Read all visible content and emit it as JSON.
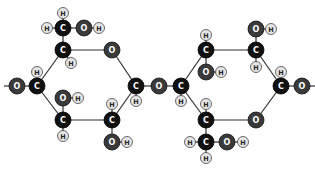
{
  "diagram": {
    "type": "molecular-structure",
    "colors": {
      "carbon": "#111111",
      "oxygen": "#3a3a3a",
      "hydrogen": "#e6e6e6",
      "carbon_label": "#ffffff",
      "oxygen_label": "#ffffff",
      "hydrogen_label": "#222222",
      "bond": "#333333"
    },
    "atoms": [
      {
        "id": "o1",
        "el": "O",
        "x": 17,
        "y": 86
      },
      {
        "id": "c1",
        "el": "C",
        "x": 37,
        "y": 86
      },
      {
        "id": "h1",
        "el": "H",
        "x": 37,
        "y": 72
      },
      {
        "id": "c5",
        "el": "C",
        "x": 63,
        "y": 50
      },
      {
        "id": "h5",
        "el": "H",
        "x": 71,
        "y": 63
      },
      {
        "id": "c6",
        "el": "C",
        "x": 63,
        "y": 28
      },
      {
        "id": "h6a",
        "el": "H",
        "x": 47,
        "y": 28
      },
      {
        "id": "h6b",
        "el": "H",
        "x": 63,
        "y": 13
      },
      {
        "id": "o6",
        "el": "O",
        "x": 84,
        "y": 28
      },
      {
        "id": "ho6",
        "el": "H",
        "x": 99,
        "y": 28
      },
      {
        "id": "or1",
        "el": "O",
        "x": 112,
        "y": 50
      },
      {
        "id": "c4",
        "el": "C",
        "x": 136,
        "y": 86
      },
      {
        "id": "h4",
        "el": "H",
        "x": 136,
        "y": 101
      },
      {
        "id": "olink",
        "el": "O",
        "x": 159,
        "y": 86
      },
      {
        "id": "c2",
        "el": "C",
        "x": 63,
        "y": 120
      },
      {
        "id": "o2",
        "el": "O",
        "x": 63,
        "y": 98
      },
      {
        "id": "ho2",
        "el": "H",
        "x": 78,
        "y": 98
      },
      {
        "id": "h2",
        "el": "H",
        "x": 63,
        "y": 136
      },
      {
        "id": "c3",
        "el": "C",
        "x": 112,
        "y": 120
      },
      {
        "id": "h3",
        "el": "H",
        "x": 112,
        "y": 104
      },
      {
        "id": "o3",
        "el": "O",
        "x": 112,
        "y": 142
      },
      {
        "id": "ho3",
        "el": "H",
        "x": 127,
        "y": 142
      },
      {
        "id": "rc1",
        "el": "C",
        "x": 181,
        "y": 86
      },
      {
        "id": "rh1",
        "el": "H",
        "x": 181,
        "y": 101
      },
      {
        "id": "rc2",
        "el": "C",
        "x": 206,
        "y": 50
      },
      {
        "id": "rh2",
        "el": "H",
        "x": 206,
        "y": 35
      },
      {
        "id": "ro2",
        "el": "O",
        "x": 206,
        "y": 72
      },
      {
        "id": "rho2",
        "el": "H",
        "x": 221,
        "y": 72
      },
      {
        "id": "rc3",
        "el": "C",
        "x": 256,
        "y": 50
      },
      {
        "id": "ro3",
        "el": "O",
        "x": 256,
        "y": 29
      },
      {
        "id": "rho3",
        "el": "H",
        "x": 271,
        "y": 29
      },
      {
        "id": "rh3",
        "el": "H",
        "x": 256,
        "y": 67
      },
      {
        "id": "rc4",
        "el": "C",
        "x": 281,
        "y": 86
      },
      {
        "id": "rh4",
        "el": "H",
        "x": 281,
        "y": 72
      },
      {
        "id": "ro4",
        "el": "O",
        "x": 302,
        "y": 86
      },
      {
        "id": "ror",
        "el": "O",
        "x": 256,
        "y": 120
      },
      {
        "id": "rc5",
        "el": "C",
        "x": 206,
        "y": 120
      },
      {
        "id": "rh5",
        "el": "H",
        "x": 206,
        "y": 104
      },
      {
        "id": "rc6",
        "el": "C",
        "x": 206,
        "y": 142
      },
      {
        "id": "rh6a",
        "el": "H",
        "x": 190,
        "y": 142
      },
      {
        "id": "rh6b",
        "el": "H",
        "x": 206,
        "y": 158
      },
      {
        "id": "ro6",
        "el": "O",
        "x": 227,
        "y": 142
      },
      {
        "id": "rho6",
        "el": "H",
        "x": 243,
        "y": 142
      }
    ],
    "bonds": [
      [
        "o1",
        "c1"
      ],
      [
        "c1",
        "h1"
      ],
      [
        "c1",
        "c5"
      ],
      [
        "c5",
        "h5"
      ],
      [
        "c5",
        "c6"
      ],
      [
        "c6",
        "h6a"
      ],
      [
        "c6",
        "h6b"
      ],
      [
        "c6",
        "o6"
      ],
      [
        "o6",
        "ho6"
      ],
      [
        "c5",
        "or1"
      ],
      [
        "or1",
        "c4"
      ],
      [
        "c4",
        "h4"
      ],
      [
        "c4",
        "olink"
      ],
      [
        "c1",
        "c2"
      ],
      [
        "c2",
        "o2"
      ],
      [
        "o2",
        "ho2"
      ],
      [
        "c2",
        "h2"
      ],
      [
        "c2",
        "c3"
      ],
      [
        "c3",
        "h3"
      ],
      [
        "c3",
        "o3"
      ],
      [
        "o3",
        "ho3"
      ],
      [
        "c3",
        "c4"
      ],
      [
        "olink",
        "rc1"
      ],
      [
        "rc1",
        "rh1"
      ],
      [
        "rc1",
        "rc2"
      ],
      [
        "rc2",
        "rh2"
      ],
      [
        "rc2",
        "ro2"
      ],
      [
        "ro2",
        "rho2"
      ],
      [
        "rc2",
        "rc3"
      ],
      [
        "rc3",
        "ro3"
      ],
      [
        "ro3",
        "rho3"
      ],
      [
        "rc3",
        "rh3"
      ],
      [
        "rc3",
        "rc4"
      ],
      [
        "rc4",
        "rh4"
      ],
      [
        "rc4",
        "ro4"
      ],
      [
        "rc4",
        "ror"
      ],
      [
        "ror",
        "rc5"
      ],
      [
        "rc5",
        "rh5"
      ],
      [
        "rc5",
        "rc1"
      ],
      [
        "rc5",
        "rc6"
      ],
      [
        "rc6",
        "rh6a"
      ],
      [
        "rc6",
        "rh6b"
      ],
      [
        "rc6",
        "ro6"
      ],
      [
        "ro6",
        "rho6"
      ]
    ],
    "edge_stubs": [
      {
        "x1": 4,
        "y1": 86,
        "x2": 17,
        "y2": 86
      },
      {
        "x1": 302,
        "y1": 86,
        "x2": 315,
        "y2": 86
      }
    ]
  }
}
